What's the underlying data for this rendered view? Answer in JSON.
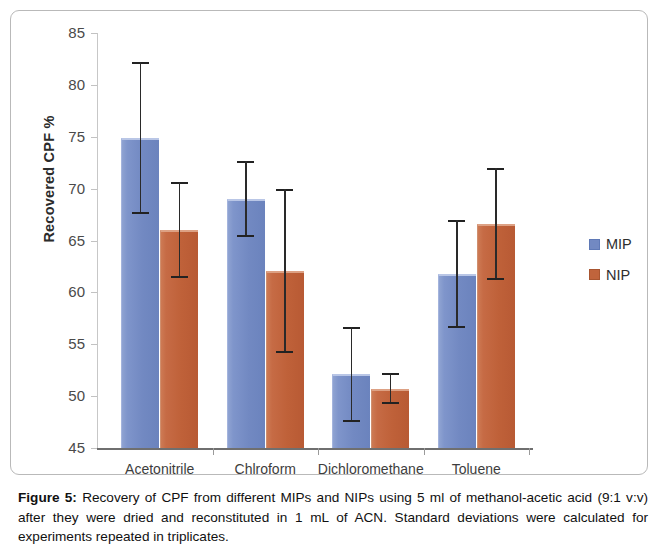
{
  "figure": {
    "label": "Figure 5:",
    "caption_text": " Recovery of CPF from different MIPs and NIPs using 5 ml of methanol-acetic acid (9:1 v:v) after they were dried and reconstituted in 1 mL of ACN. Standard deviations were calculated for experiments repeated in triplicates."
  },
  "legend": {
    "position": "right",
    "entries": [
      {
        "label": "MIP",
        "color": "#7289c2"
      },
      {
        "label": "NIP",
        "color": "#c0643c"
      }
    ]
  },
  "axis": {
    "y_title": "Recovered CPF %",
    "y_ticks": [
      "45",
      "50",
      "55",
      "60",
      "65",
      "70",
      "75",
      "80",
      "85"
    ]
  },
  "chart_data": {
    "type": "bar",
    "title": "",
    "xlabel": "",
    "ylabel": "Recovered CPF %",
    "ylim": [
      45,
      85
    ],
    "ytick_interval": 5,
    "grid": false,
    "legend_position": "right",
    "error_bars": "standard deviation (n=3)",
    "categories": [
      "Acetonitrile",
      "Chlroform",
      "Dichloromethane",
      "Toluene"
    ],
    "series": [
      {
        "name": "MIP",
        "color": "#7289c2",
        "values": [
          74.9,
          69.0,
          52.1,
          61.8
        ],
        "errors": [
          7.3,
          3.7,
          4.6,
          5.2
        ]
      },
      {
        "name": "NIP",
        "color": "#c0643c",
        "values": [
          66.0,
          62.1,
          50.7,
          66.6
        ],
        "errors": [
          4.6,
          7.9,
          1.5,
          5.4
        ]
      }
    ]
  }
}
